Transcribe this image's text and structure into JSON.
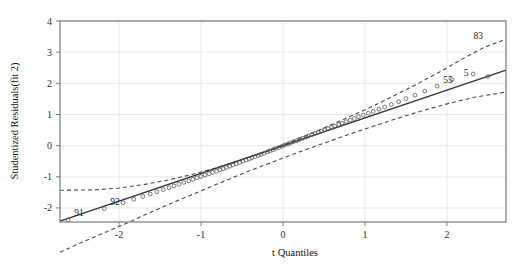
{
  "chart_data": {
    "type": "scatter",
    "title": "",
    "xlabel": "t Quantiles",
    "ylabel": "Studentized Residuals(fit 2)",
    "xlim": [
      -2.72,
      2.72
    ],
    "ylim": [
      -2.45,
      4.0
    ],
    "xticks": [
      -2,
      -1,
      0,
      1,
      2
    ],
    "xticklabels": [
      "-2",
      "-1",
      "0",
      "1",
      "2"
    ],
    "yticks": [
      -2,
      -1,
      0,
      1,
      2,
      3,
      4
    ],
    "yticklabels": [
      "-2",
      "-1",
      "0",
      "1",
      "2",
      "3",
      "4"
    ],
    "grid": true,
    "legend": null,
    "colors": {
      "point": "#555555",
      "reference_line": "#333333",
      "envelope": "#4a4a4a",
      "grid": "#e8e8e8",
      "frame": "#7a7a7a",
      "background": "#ffffff"
    },
    "reference_line": {
      "style": "solid",
      "x": [
        -2.72,
        2.72
      ],
      "y": [
        -2.42,
        2.42
      ]
    },
    "envelope_upper": {
      "style": "dashed",
      "x": [
        -2.72,
        -2.3,
        -2.0,
        -1.7,
        -1.4,
        -1.1,
        -0.8,
        -0.5,
        -0.2,
        0.1,
        0.4,
        0.7,
        1.0,
        1.3,
        1.6,
        1.9,
        2.2,
        2.45,
        2.72
      ],
      "y": [
        -1.43,
        -1.42,
        -1.36,
        -1.25,
        -1.1,
        -0.92,
        -0.7,
        -0.45,
        -0.18,
        0.12,
        0.45,
        0.8,
        1.15,
        1.53,
        1.93,
        2.35,
        2.8,
        3.15,
        3.42
      ]
    },
    "envelope_lower": {
      "style": "dashed",
      "x": [
        -2.72,
        -2.45,
        -2.2,
        -1.9,
        -1.6,
        -1.3,
        -1.0,
        -0.7,
        -0.4,
        -0.1,
        0.2,
        0.5,
        0.8,
        1.1,
        1.4,
        1.7,
        2.0,
        2.35,
        2.72
      ],
      "y": [
        -3.42,
        -3.1,
        -2.82,
        -2.48,
        -2.12,
        -1.78,
        -1.45,
        -1.12,
        -0.8,
        -0.5,
        -0.2,
        0.08,
        0.36,
        0.62,
        0.88,
        1.12,
        1.34,
        1.56,
        1.72
      ]
    },
    "points": [
      {
        "x": -2.62,
        "y": -2.38
      },
      {
        "x": -2.18,
        "y": -2.02
      },
      {
        "x": -1.95,
        "y": -1.83
      },
      {
        "x": -1.82,
        "y": -1.72
      },
      {
        "x": -1.71,
        "y": -1.63
      },
      {
        "x": -1.62,
        "y": -1.55
      },
      {
        "x": -1.54,
        "y": -1.48
      },
      {
        "x": -1.46,
        "y": -1.41
      },
      {
        "x": -1.39,
        "y": -1.35
      },
      {
        "x": -1.33,
        "y": -1.29
      },
      {
        "x": -1.27,
        "y": -1.24
      },
      {
        "x": -1.21,
        "y": -1.18
      },
      {
        "x": -1.15,
        "y": -1.13
      },
      {
        "x": -1.1,
        "y": -1.08
      },
      {
        "x": -1.05,
        "y": -1.03
      },
      {
        "x": -1.0,
        "y": -0.99
      },
      {
        "x": -0.95,
        "y": -0.94
      },
      {
        "x": -0.9,
        "y": -0.9
      },
      {
        "x": -0.86,
        "y": -0.86
      },
      {
        "x": -0.81,
        "y": -0.82
      },
      {
        "x": -0.77,
        "y": -0.78
      },
      {
        "x": -0.73,
        "y": -0.74
      },
      {
        "x": -0.69,
        "y": -0.7
      },
      {
        "x": -0.65,
        "y": -0.66
      },
      {
        "x": -0.61,
        "y": -0.62
      },
      {
        "x": -0.57,
        "y": -0.58
      },
      {
        "x": -0.53,
        "y": -0.54
      },
      {
        "x": -0.49,
        "y": -0.5
      },
      {
        "x": -0.45,
        "y": -0.46
      },
      {
        "x": -0.41,
        "y": -0.43
      },
      {
        "x": -0.38,
        "y": -0.39
      },
      {
        "x": -0.34,
        "y": -0.35
      },
      {
        "x": -0.3,
        "y": -0.31
      },
      {
        "x": -0.27,
        "y": -0.28
      },
      {
        "x": -0.23,
        "y": -0.24
      },
      {
        "x": -0.19,
        "y": -0.2
      },
      {
        "x": -0.16,
        "y": -0.17
      },
      {
        "x": -0.12,
        "y": -0.13
      },
      {
        "x": -0.09,
        "y": -0.09
      },
      {
        "x": -0.05,
        "y": -0.06
      },
      {
        "x": -0.01,
        "y": -0.02
      },
      {
        "x": 0.02,
        "y": 0.02
      },
      {
        "x": 0.06,
        "y": 0.05
      },
      {
        "x": 0.09,
        "y": 0.09
      },
      {
        "x": 0.13,
        "y": 0.13
      },
      {
        "x": 0.17,
        "y": 0.16
      },
      {
        "x": 0.2,
        "y": 0.2
      },
      {
        "x": 0.24,
        "y": 0.24
      },
      {
        "x": 0.28,
        "y": 0.28
      },
      {
        "x": 0.31,
        "y": 0.31
      },
      {
        "x": 0.35,
        "y": 0.35
      },
      {
        "x": 0.39,
        "y": 0.39
      },
      {
        "x": 0.43,
        "y": 0.43
      },
      {
        "x": 0.47,
        "y": 0.47
      },
      {
        "x": 0.51,
        "y": 0.51
      },
      {
        "x": 0.55,
        "y": 0.55
      },
      {
        "x": 0.59,
        "y": 0.59
      },
      {
        "x": 0.63,
        "y": 0.63
      },
      {
        "x": 0.68,
        "y": 0.68
      },
      {
        "x": 0.72,
        "y": 0.72
      },
      {
        "x": 0.77,
        "y": 0.77
      },
      {
        "x": 0.82,
        "y": 0.82
      },
      {
        "x": 0.87,
        "y": 0.87
      },
      {
        "x": 0.92,
        "y": 0.93
      },
      {
        "x": 0.98,
        "y": 0.98
      },
      {
        "x": 1.04,
        "y": 1.04
      },
      {
        "x": 1.1,
        "y": 1.1
      },
      {
        "x": 1.17,
        "y": 1.17
      },
      {
        "x": 1.24,
        "y": 1.24
      },
      {
        "x": 1.32,
        "y": 1.32
      },
      {
        "x": 1.41,
        "y": 1.41
      },
      {
        "x": 1.5,
        "y": 1.51
      },
      {
        "x": 1.61,
        "y": 1.62
      },
      {
        "x": 1.73,
        "y": 1.75
      },
      {
        "x": 1.88,
        "y": 1.91
      },
      {
        "x": 2.06,
        "y": 2.12
      },
      {
        "x": 2.32,
        "y": 2.3
      },
      {
        "x": 2.5,
        "y": 2.22
      }
    ],
    "point_labels": [
      {
        "text": "91",
        "x": -2.62,
        "y": -2.38,
        "dx": 6,
        "dy": -4
      },
      {
        "text": "92",
        "x": -2.18,
        "y": -2.02,
        "dx": 6,
        "dy": -4
      },
      {
        "text": "55",
        "x": 1.88,
        "y": 1.91,
        "dx": 6,
        "dy": -3
      },
      {
        "text": "5",
        "x": 2.12,
        "y": 2.12,
        "dx": 7,
        "dy": -4
      },
      {
        "text": "83",
        "x": 2.42,
        "y": 3.27,
        "dx": -8,
        "dy": -5
      }
    ]
  }
}
